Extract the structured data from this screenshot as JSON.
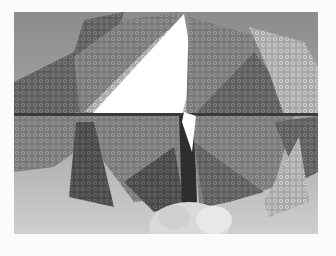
{
  "image": {
    "subject": "origami-model",
    "description": "Grayscale photo of a folded origami model made from patterned paper, held by fingers at the bottom",
    "colors": {
      "border": "#fbfbfb",
      "background_top": "#8f8f8f",
      "background_bottom": "#c9c9c9",
      "paper_dark": "#5a5a5a",
      "paper_mid": "#7d7d7d",
      "paper_light": "#b5b5b5",
      "white_flap": "#ffffff",
      "skin": "#d8d8d8"
    }
  }
}
